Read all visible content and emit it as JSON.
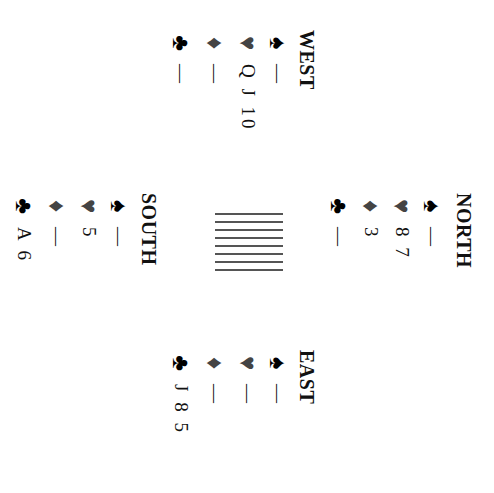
{
  "seats": {
    "north": {
      "name": "NORTH",
      "hand": [
        {
          "suit": "spade",
          "glyph": "♠",
          "cards": "—"
        },
        {
          "suit": "heart",
          "glyph": "♥",
          "cards": "8 7"
        },
        {
          "suit": "diamond",
          "glyph": "♦",
          "cards": "3"
        },
        {
          "suit": "club",
          "glyph": "♣",
          "cards": "—"
        }
      ]
    },
    "west": {
      "name": "WEST",
      "hand": [
        {
          "suit": "spade",
          "glyph": "♠",
          "cards": "—"
        },
        {
          "suit": "heart",
          "glyph": "♥",
          "cards": "Q J 10"
        },
        {
          "suit": "diamond",
          "glyph": "♦",
          "cards": "—"
        },
        {
          "suit": "club",
          "glyph": "♣",
          "cards": "—"
        }
      ]
    },
    "east": {
      "name": "EAST",
      "hand": [
        {
          "suit": "spade",
          "glyph": "♠",
          "cards": "—"
        },
        {
          "suit": "heart",
          "glyph": "♥",
          "cards": "—"
        },
        {
          "suit": "diamond",
          "glyph": "♦",
          "cards": "—"
        },
        {
          "suit": "club",
          "glyph": "♣",
          "cards": "J 8 5"
        }
      ]
    },
    "south": {
      "name": "SOUTH",
      "hand": [
        {
          "suit": "spade",
          "glyph": "♠",
          "cards": "—"
        },
        {
          "suit": "heart",
          "glyph": "♥",
          "cards": "5"
        },
        {
          "suit": "diamond",
          "glyph": "♦",
          "cards": "—"
        },
        {
          "suit": "club",
          "glyph": "♣",
          "cards": "A 6"
        }
      ]
    }
  },
  "center": {
    "icon": "table-lines-icon",
    "line_count": 8
  },
  "colors": {
    "black_suit": "#000000",
    "red_suit": "#444444",
    "text": "#111111"
  }
}
